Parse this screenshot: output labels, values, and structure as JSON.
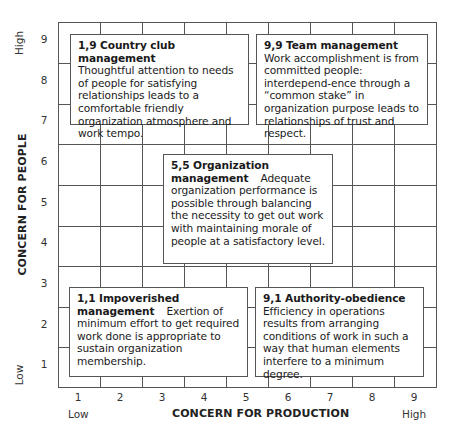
{
  "diagram": {
    "type": "managerial-grid",
    "x_axis": {
      "title": "CONCERN FOR PRODUCTION",
      "low_label": "Low",
      "high_label": "High",
      "ticks": [
        "1",
        "2",
        "3",
        "4",
        "5",
        "6",
        "7",
        "8",
        "9"
      ]
    },
    "y_axis": {
      "title": "CONCERN FOR PEOPLE",
      "low_label": "Low",
      "high_label": "High",
      "ticks": [
        "9",
        "8",
        "7",
        "6",
        "5",
        "4",
        "3",
        "2",
        "1"
      ]
    },
    "styles": [
      {
        "id": "1,9",
        "title": "1,9 Country club management",
        "description": "Thoughtful attention to needs of people for satisfying relationships leads to a comfortable friendly organization atmosphere and work tempo."
      },
      {
        "id": "9,9",
        "title": "9,9 Team management",
        "description": "Work accomplishment is from committed people: interdepend-ence through a “common stake” in organization purpose leads to relationships of trust and respect."
      },
      {
        "id": "5,5",
        "title": "5,5 Organization management",
        "description": "Adequate organization performance is possible through balancing the necessity to get out work with maintaining morale of people at a satisfactory level."
      },
      {
        "id": "1,1",
        "title": "1,1 Impoverished management",
        "description": "Exertion of minimum effort to get required work done is appropriate to sustain organization membership."
      },
      {
        "id": "9,1",
        "title": "9,1 Authority-obedience",
        "description": "Efficiency in operations results from arranging conditions of work in such a way that human elements interfere to a minimum degree."
      }
    ]
  },
  "colors": {
    "line": "#555555",
    "text": "#1a1a1a",
    "background": "#ffffff"
  }
}
